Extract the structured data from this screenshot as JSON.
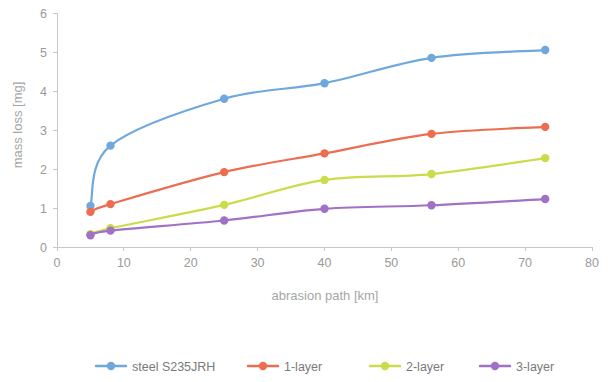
{
  "chart_data": {
    "type": "line",
    "title": "",
    "xlabel": "abrasion path [km]",
    "ylabel": "mass loss [mg]",
    "xlim": [
      0,
      80
    ],
    "ylim": [
      0,
      6
    ],
    "xticks": [
      "0",
      "10",
      "20",
      "30",
      "40",
      "50",
      "60",
      "70",
      "80"
    ],
    "yticks": [
      "0",
      "1",
      "2",
      "3",
      "4",
      "5",
      "6"
    ],
    "grid": false,
    "legend_position": "bottom",
    "x": [
      5,
      8,
      25,
      40,
      56,
      73
    ],
    "series": [
      {
        "name": "steel S235JRH",
        "color": "#6FA8DC",
        "values": [
          1.05,
          2.6,
          3.8,
          4.2,
          4.85,
          5.05
        ]
      },
      {
        "name": "1-layer",
        "color": "#EC6D50",
        "values": [
          0.9,
          1.1,
          1.92,
          2.4,
          2.9,
          3.08
        ]
      },
      {
        "name": "2-layer",
        "color": "#CBDB4A",
        "values": [
          0.33,
          0.48,
          1.08,
          1.72,
          1.87,
          2.28
        ]
      },
      {
        "name": "3-layer",
        "color": "#A071C4",
        "values": [
          0.3,
          0.42,
          0.68,
          0.98,
          1.07,
          1.23
        ]
      }
    ]
  },
  "axes": {
    "x_title": "abrasion path [km]",
    "y_title": "mass loss [mg]",
    "x_tick_labels": [
      "0",
      "10",
      "20",
      "30",
      "40",
      "50",
      "60",
      "70",
      "80"
    ],
    "y_tick_labels": [
      "0",
      "1",
      "2",
      "3",
      "4",
      "5",
      "6"
    ]
  },
  "legend": {
    "items": [
      {
        "label": "steel S235JRH",
        "color": "#6FA8DC"
      },
      {
        "label": "1-layer",
        "color": "#EC6D50"
      },
      {
        "label": "2-layer",
        "color": "#CBDB4A"
      },
      {
        "label": "3-layer",
        "color": "#A071C4"
      }
    ]
  }
}
